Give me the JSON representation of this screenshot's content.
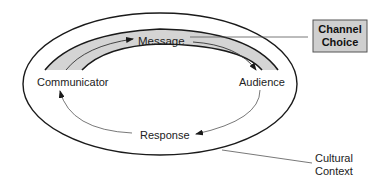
{
  "diagram": {
    "type": "communication-model",
    "nodes": {
      "communicator": "Communicator",
      "message": "Message",
      "audience": "Audience",
      "response": "Response"
    },
    "callouts": {
      "channel_choice_line1": "Channel",
      "channel_choice_line2": "Choice",
      "cultural_context_line1": "Cultural",
      "cultural_context_line2": "Context"
    },
    "flows": [
      {
        "from": "Communicator",
        "to": "Message"
      },
      {
        "from": "Message",
        "to": "Audience"
      },
      {
        "from": "Audience",
        "to": "Response"
      },
      {
        "from": "Response",
        "to": "Communicator"
      }
    ],
    "colors": {
      "band_fill": "#d4d4d4",
      "box_fill": "#cfcfcf",
      "stroke": "#1a1a1a",
      "thin_stroke": "#555555"
    }
  }
}
